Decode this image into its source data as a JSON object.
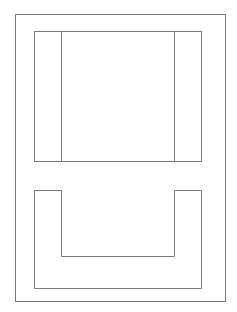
{
  "diagram": {
    "canvas": {
      "width": 237,
      "height": 312,
      "background": "#ffffff"
    },
    "stroke_color": "#7a7a7a",
    "stroke_width": 1,
    "outer_frame": {
      "x": 15,
      "y": 14,
      "width": 210,
      "height": 287
    },
    "upper_panel": {
      "x": 34,
      "y": 31,
      "width": 167,
      "height": 130,
      "dividers_x": [
        61,
        174
      ]
    },
    "lower_u_shape": {
      "points": "34,190 61,190 61,256 174,256 174,190 201,190 201,288 34,288"
    }
  }
}
